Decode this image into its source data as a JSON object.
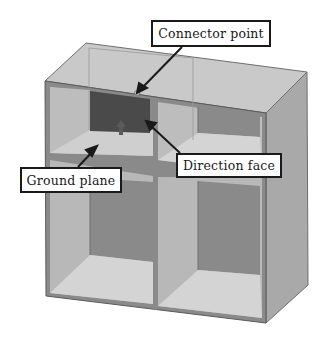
{
  "diagram": {
    "labels": {
      "connector_point": "Connector point",
      "ground_plane": "Ground plane",
      "direction_face": "Direction face"
    },
    "colors": {
      "background": "#ffffff",
      "frame_edge": "#6e6e6e",
      "top_face": "#c9c9c9",
      "side_face": "#a9a9a9",
      "light_wall": "#bcbcbc",
      "floor": "#d4d4d4",
      "back_panel": "#8a8a8a",
      "direction_face": "#4a4a4a",
      "arrow": "#1a1a1a",
      "label_border": "#1a1a1a"
    },
    "compartments": [
      "top-left",
      "top-right",
      "bottom-left",
      "bottom-right"
    ]
  }
}
